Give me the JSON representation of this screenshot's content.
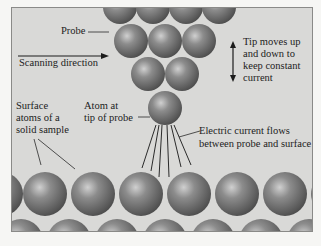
{
  "diagram": {
    "labels": {
      "probe": "Probe",
      "scanning_direction": "Scanning direction",
      "tip_moves_l1": "Tip moves up",
      "tip_moves_l2": "and down to",
      "tip_moves_l3": "keep constant",
      "tip_moves_l4": "current",
      "surface_l1": "Surface",
      "surface_l2": "atoms of a",
      "surface_l3": "solid sample",
      "atom_tip_l1": "Atom at",
      "atom_tip_l2": "tip of probe",
      "current_l1": "Electric current flows",
      "current_l2": "between probe and surface"
    },
    "colors": {
      "panel": "#d9d9d7",
      "atom_dark": "#5a5a5a",
      "atom_light": "#c4c4c4",
      "text": "#1c1c1c"
    }
  }
}
